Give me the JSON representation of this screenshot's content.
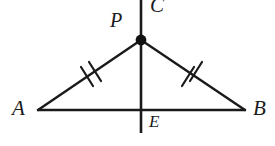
{
  "figure": {
    "background_color": "#ffffff",
    "stroke_color": "#1a1a1a",
    "width": 275,
    "height": 146,
    "labels": {
      "A": "A",
      "B": "B",
      "P": "P",
      "C": "C",
      "E": "E"
    },
    "points": {
      "A": {
        "x": 38,
        "y": 110
      },
      "B": {
        "x": 245,
        "y": 110
      },
      "P": {
        "x": 141,
        "y": 40
      },
      "E": {
        "x": 141,
        "y": 110
      },
      "C_top": {
        "x": 141,
        "y": 0
      },
      "line_bottom": {
        "x": 141,
        "y": 133
      }
    },
    "segments": [
      {
        "name": "AP",
        "from": "A",
        "to": "P",
        "ticks": 2
      },
      {
        "name": "PB",
        "from": "P",
        "to": "B",
        "ticks": 2
      },
      {
        "name": "AB",
        "from": "A",
        "to": "B",
        "ticks": 0
      },
      {
        "name": "CE",
        "from": "C_top",
        "to": "line_bottom",
        "ticks": 0
      }
    ],
    "marked_point": "P",
    "tick_mark_count": 2
  }
}
